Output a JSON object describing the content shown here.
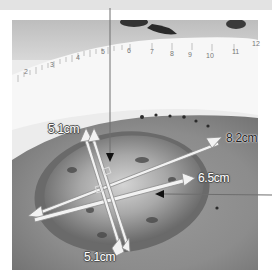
{
  "figure": {
    "type": "annotated clinical photograph",
    "colors": {
      "background": "#ffffff",
      "top_band": "#e3e3e3",
      "callout_line": "#6e6e6e",
      "arrow_fill": "#f2f2f2",
      "arrow_outline": "#8a8a8a"
    }
  },
  "ruler": {
    "ticks": [
      "2",
      "3",
      "4",
      "5",
      "6",
      "7",
      "8",
      "9",
      "10",
      "11",
      "12"
    ]
  },
  "measurements": [
    {
      "id": "length-vertical-top",
      "label": "5.1cm"
    },
    {
      "id": "diagonal-long",
      "label": "8.2cm"
    },
    {
      "id": "diagonal-short",
      "label": "6.5cm"
    },
    {
      "id": "length-vertical-bottom",
      "label": "5.1cm"
    }
  ],
  "callouts": [
    {
      "id": "callout-top",
      "direction": "from top edge to wound center"
    },
    {
      "id": "callout-right",
      "direction": "from right edge to wound interior"
    }
  ]
}
